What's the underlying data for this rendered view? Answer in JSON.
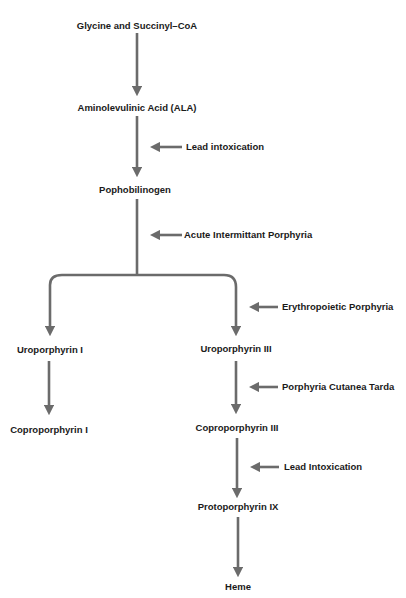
{
  "diagram": {
    "colors": {
      "arrow": "#6b6b6b",
      "text": "#1a1a1a",
      "background": "#ffffff"
    },
    "nodes": {
      "glycine": "Glycine and Succinyl–CoA",
      "ala": "Aminolevulinic Acid (ALA)",
      "pbg": "Pophobilinogen",
      "uro1": "Uroporphyrin I",
      "uro3": "Uroporphyrin III",
      "copro1": "Coproporphyrin I",
      "copro3": "Coproporphyrin III",
      "proto9": "Protoporphyrin IX",
      "heme": "Heme"
    },
    "inhibitors": {
      "lead1": "Lead intoxication",
      "aip": "Acute Intermittant Porphyria",
      "ep": "Erythropoietic Porphyria",
      "pct": "Porphyria Cutanea Tarda",
      "lead2": "Lead Intoxication"
    },
    "edges": [
      [
        "glycine",
        "ala"
      ],
      [
        "ala",
        "pbg"
      ],
      [
        "pbg",
        "uro1"
      ],
      [
        "pbg",
        "uro3"
      ],
      [
        "uro1",
        "copro1"
      ],
      [
        "uro3",
        "copro3"
      ],
      [
        "copro3",
        "proto9"
      ],
      [
        "proto9",
        "heme"
      ]
    ],
    "blocks": [
      [
        "lead1",
        "ala→pbg"
      ],
      [
        "aip",
        "pbg→uro"
      ],
      [
        "ep",
        "pbg→uro3"
      ],
      [
        "pct",
        "uro3→copro3"
      ],
      [
        "lead2",
        "copro3→proto9"
      ]
    ]
  }
}
